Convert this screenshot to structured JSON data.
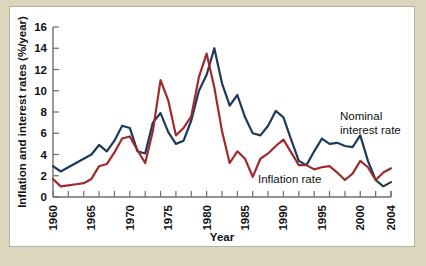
{
  "chart_data": {
    "type": "line",
    "title": "",
    "xlabel": "Year",
    "ylabel": "Inflation and interest rates (%/year)",
    "xlim": [
      1960,
      2004
    ],
    "ylim": [
      0,
      16
    ],
    "ytick_step": 2,
    "xtick_step_minor": 2,
    "grid": false,
    "legend": "inline-annotations",
    "xticklabels": [
      "1960",
      "1965",
      "1970",
      "1975",
      "1980",
      "1985",
      "1990",
      "1995",
      "2000",
      "2004"
    ],
    "xticklabel_values": [
      1960,
      1965,
      1970,
      1975,
      1980,
      1985,
      1990,
      1995,
      2000,
      2004
    ],
    "yticklabels": [
      "0",
      "2",
      "4",
      "6",
      "8",
      "10",
      "12",
      "14",
      "16"
    ],
    "yticklabel_values": [
      0,
      2,
      4,
      6,
      8,
      10,
      12,
      14,
      16
    ],
    "x": [
      1960,
      1961,
      1962,
      1963,
      1964,
      1965,
      1966,
      1967,
      1968,
      1969,
      1970,
      1971,
      1972,
      1973,
      1974,
      1975,
      1976,
      1977,
      1978,
      1979,
      1980,
      1981,
      1982,
      1983,
      1984,
      1985,
      1986,
      1987,
      1988,
      1989,
      1990,
      1991,
      1992,
      1993,
      1994,
      1995,
      1996,
      1997,
      1998,
      1999,
      2000,
      2001,
      2002,
      2003,
      2004
    ],
    "series": [
      {
        "name": "Nominal interest rate",
        "color": "#1b3a5c",
        "values": [
          2.9,
          2.4,
          2.8,
          3.2,
          3.6,
          4.0,
          4.9,
          4.3,
          5.3,
          6.7,
          6.5,
          4.3,
          4.1,
          7.0,
          7.9,
          6.1,
          5.0,
          5.3,
          7.2,
          10.0,
          11.5,
          14.0,
          10.7,
          8.6,
          9.6,
          7.5,
          6.0,
          5.8,
          6.7,
          8.1,
          7.5,
          5.4,
          3.4,
          3.0,
          4.3,
          5.5,
          5.0,
          5.1,
          4.8,
          4.7,
          5.8,
          3.4,
          1.6,
          1.0,
          1.4
        ]
      },
      {
        "name": "Inflation rate",
        "color": "#9e2b2b",
        "values": [
          1.7,
          1.0,
          1.1,
          1.2,
          1.3,
          1.7,
          2.9,
          3.1,
          4.2,
          5.5,
          5.7,
          4.4,
          3.2,
          6.2,
          11.0,
          9.1,
          5.8,
          6.5,
          7.6,
          11.3,
          13.5,
          10.3,
          6.2,
          3.2,
          4.3,
          3.6,
          1.9,
          3.6,
          4.1,
          4.8,
          5.4,
          4.2,
          3.0,
          3.0,
          2.6,
          2.8,
          2.9,
          2.3,
          1.6,
          2.2,
          3.4,
          2.8,
          1.6,
          2.3,
          2.7
        ]
      }
    ],
    "annotations": [
      {
        "text_line1": "Nominal",
        "text_line2": "interest rate",
        "x_px": 330,
        "y_px": 113
      },
      {
        "text_line1": "Inflation rate",
        "text_line2": "",
        "x_px": 248,
        "y_px": 176
      }
    ]
  },
  "colors": {
    "page_background": "#dcd6bc",
    "panel_background": "#ffffff",
    "panel_border": "#b3b0a4",
    "axis": "#6e6e6e",
    "nominal": "#1b3a5c",
    "inflation": "#9e2b2b",
    "text": "#111111"
  }
}
